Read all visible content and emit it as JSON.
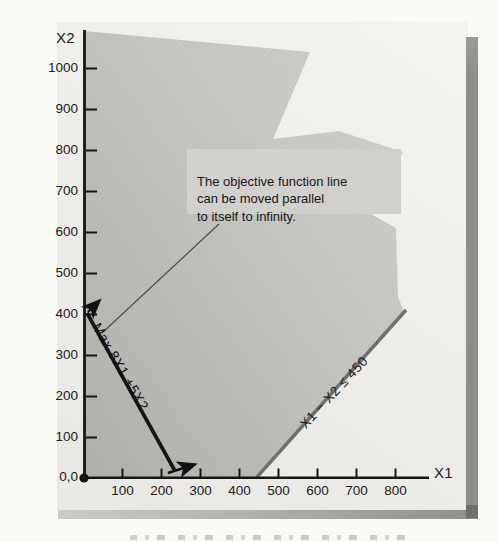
{
  "figure": {
    "y_axis_label": "X2",
    "x_axis_label": "X1",
    "origin_label": "0,0",
    "x_tick_labels": [
      "100",
      "200",
      "300",
      "400",
      "500",
      "600",
      "700",
      "800"
    ],
    "y_tick_labels": [
      "100",
      "200",
      "300",
      "400",
      "500",
      "600",
      "700",
      "800",
      "900",
      "1000"
    ],
    "objective_label": "Max 8X1 +5X2",
    "constraint_label": "X1 − X2 ≤ 450",
    "annotation_text": "The objective function line\ncan be moved parallel\nto itself to infinity.",
    "colors": {
      "objective_line": "#151515",
      "constraint_line": "#707070",
      "feasible_region_fill": "#c1c1be",
      "annotation_box_bg": "#d1d0cd",
      "panel_bg": "#edece8",
      "shadow": "#8d8d8b",
      "text": "#1b1b1b"
    }
  },
  "chart_data": {
    "type": "line",
    "title": "",
    "xlabel": "X1",
    "ylabel": "X2",
    "xlim": [
      0,
      880
    ],
    "ylim": [
      0,
      1080
    ],
    "x_ticks": [
      100,
      200,
      300,
      400,
      500,
      600,
      700,
      800
    ],
    "y_ticks": [
      100,
      200,
      300,
      400,
      500,
      600,
      700,
      800,
      900,
      1000
    ],
    "grid": false,
    "legend": "none",
    "series": [
      {
        "name": "Max 8X1 +5X2",
        "role": "objective function line",
        "points": [
          [
            0,
            400
          ],
          [
            250,
            0
          ]
        ],
        "color": "#151515",
        "style": "thick solid, arrows at both ends pointing up-right (direction of increase)"
      },
      {
        "name": "X1 − X2 ≤ 450",
        "role": "constraint boundary",
        "points": [
          [
            450,
            0
          ],
          [
            820,
            365
          ]
        ],
        "color": "#707070",
        "style": "solid gray"
      }
    ],
    "feasible_region": {
      "description": "Shaded region satisfying X1 ≥ 0, X2 ≥ 0 and X1 − X2 ≤ 450; unbounded above (drawn with torn/jagged upper-right edge)",
      "fill": "#c1c1be",
      "unbounded": true
    },
    "annotations": [
      {
        "text": "The objective function line can be moved parallel to itself to infinity.",
        "points_to": "objective function line"
      }
    ]
  }
}
